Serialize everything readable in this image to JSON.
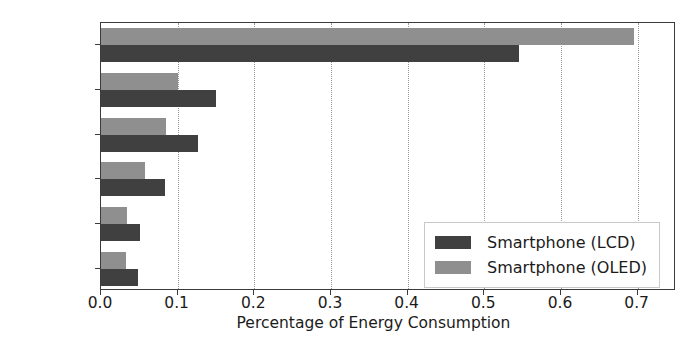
{
  "chart_data": {
    "type": "bar",
    "orientation": "horizontal",
    "title": "",
    "xlabel": "Percentage of Energy Consumption",
    "ylabel": "",
    "categories": [
      "Display",
      "CPU",
      "Graphics",
      "GSM",
      "RAM",
      "Rest"
    ],
    "series": [
      {
        "name": "Smartphone (LCD)",
        "color": "#404040",
        "values": [
          0.545,
          0.15,
          0.127,
          0.084,
          0.051,
          0.048
        ]
      },
      {
        "name": "Smartphone (OLED)",
        "color": "#8f8f8f",
        "values": [
          0.695,
          0.1,
          0.085,
          0.058,
          0.034,
          0.033
        ]
      }
    ],
    "xlim": [
      0.0,
      0.75
    ],
    "xticks": [
      0.0,
      0.1,
      0.2,
      0.3,
      0.4,
      0.5,
      0.6,
      0.7
    ],
    "xtick_labels": [
      "0.0",
      "0.1",
      "0.2",
      "0.3",
      "0.4",
      "0.5",
      "0.6",
      "0.7"
    ],
    "grid": "vertical-dotted",
    "legend_position": "lower right"
  },
  "legend": {
    "entries": [
      {
        "label": "Smartphone (LCD)",
        "color": "#404040"
      },
      {
        "label": "Smartphone (OLED)",
        "color": "#8f8f8f"
      }
    ]
  },
  "axes": {
    "x_label": "Percentage of Energy Consumption"
  }
}
